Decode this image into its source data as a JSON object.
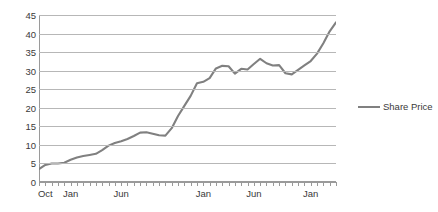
{
  "chart_data": {
    "type": "line",
    "title": "",
    "xlabel": "",
    "ylabel": "",
    "ylim": [
      0,
      45
    ],
    "ytick_step": 5,
    "ytick_labels": [
      "45",
      "40",
      "35",
      "30",
      "25",
      "20",
      "15",
      "10",
      "5",
      "0"
    ],
    "yticks": [
      45,
      40,
      35,
      30,
      25,
      20,
      15,
      10,
      5,
      0
    ],
    "grid": true,
    "legend_position": "right",
    "line_color": "#808080",
    "grid_color": "#b7b7b7",
    "axis_color": "#9a9a9a",
    "text_color": "#3a3a3a",
    "series": [
      {
        "name": "Share Price",
        "values": [
          3.5,
          4.6,
          5.0,
          5.0,
          5.2,
          6.0,
          6.6,
          7.0,
          7.3,
          7.6,
          8.6,
          9.8,
          10.5,
          11.0,
          11.6,
          12.4,
          13.3,
          13.4,
          13.0,
          12.6,
          12.5,
          14.5,
          17.8,
          20.5,
          23.2,
          26.6,
          27.0,
          28.0,
          30.6,
          31.3,
          31.2,
          29.2,
          30.5,
          30.3,
          31.8,
          33.2,
          32.0,
          31.4,
          31.5,
          29.3,
          29.0,
          30.2,
          31.4,
          32.6,
          34.6,
          37.4,
          40.6,
          43.0
        ]
      }
    ],
    "x_tick_count": 48,
    "x_tick_labels": [
      {
        "label": "Oct",
        "index": 1
      },
      {
        "label": "Jan",
        "index": 5
      },
      {
        "label": "Jun",
        "index": 13
      },
      {
        "label": "Jan",
        "index": 26
      },
      {
        "label": "Jun",
        "index": 34
      },
      {
        "label": "Jan",
        "index": 43
      }
    ]
  },
  "legend": {
    "entries": [
      {
        "label": "Share Price",
        "color": "#808080"
      }
    ]
  }
}
